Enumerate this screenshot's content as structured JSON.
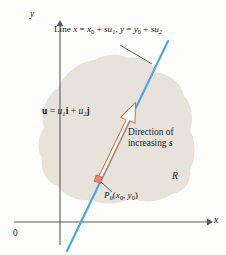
{
  "figure": {
    "width": 226,
    "height": 255,
    "background": "#fdfdfb"
  },
  "colors": {
    "region_fill": "#e7e3da",
    "line": "#4aa8de",
    "vector_outline": "#d9734e",
    "point_marker": "#e8887a",
    "axis": "#5a5a5a",
    "text": "#1a1a1a",
    "leader": "#4a4a4a"
  },
  "axes": {
    "x_label": "x",
    "y_label": "y",
    "origin_label": "0",
    "x_axis_y": 222,
    "y_axis_x": 60,
    "x_axis_end": 211,
    "y_axis_top": 22
  },
  "labels": {
    "line_equation": {
      "prefix": "Line ",
      "x_var": "x",
      "eq1": " = ",
      "x0": "x",
      "x0_sub": "0",
      "plus1": " + ",
      "s1": "s",
      "u1": "u",
      "u1_sub": "1",
      "comma": ", ",
      "y_var": "y",
      "eq2": " = ",
      "y0": "y",
      "y0_sub": "0",
      "plus2": " + ",
      "s2": "s",
      "u2": "u",
      "u2_sub": "2"
    },
    "vector": {
      "u_bold": "u",
      "eq": " = ",
      "u1": "u",
      "u1_sub": "1",
      "i_bold": "i",
      "plus": " + ",
      "u2": "u",
      "u2_sub": "2",
      "j_bold": "j"
    },
    "direction": {
      "line1": "Direction of",
      "line2_prefix": "increasing ",
      "line2_var": "s"
    },
    "region": "R",
    "point": {
      "p": "P",
      "p_sub": "0",
      "open": "(",
      "x0": "x",
      "x0_sub": "0",
      "comma": ", ",
      "y0": "y",
      "y0_sub": "0",
      "close": ")"
    }
  },
  "shapes": {
    "region_path": "M 44 128 C 40 112 46 96 58 88 C 64 74 78 62 94 60 C 104 54 118 52 128 58 C 140 56 152 62 156 72 C 170 74 182 84 184 96 C 192 104 194 118 190 130 C 196 142 196 158 190 170 C 192 182 184 192 172 194 C 160 202 144 204 132 198 C 120 204 104 206 92 200 C 78 202 64 196 58 186 C 46 182 40 170 42 158 C 36 148 38 136 44 128 Z",
    "line_start": {
      "x": 168,
      "y": 41
    },
    "line_end": {
      "x": 67,
      "y": 251
    },
    "arrow_tail": {
      "x": 99,
      "y": 180
    },
    "arrow_tip": {
      "x": 134,
      "y": 104
    },
    "point_marker": {
      "x": 98,
      "y": 179
    },
    "leader_start": {
      "x": 120,
      "y": 45
    },
    "leader_end": {
      "x": 152,
      "y": 64
    },
    "point_leader_start": {
      "x": 112,
      "y": 192
    },
    "point_leader_end": {
      "x": 101,
      "y": 182
    }
  }
}
